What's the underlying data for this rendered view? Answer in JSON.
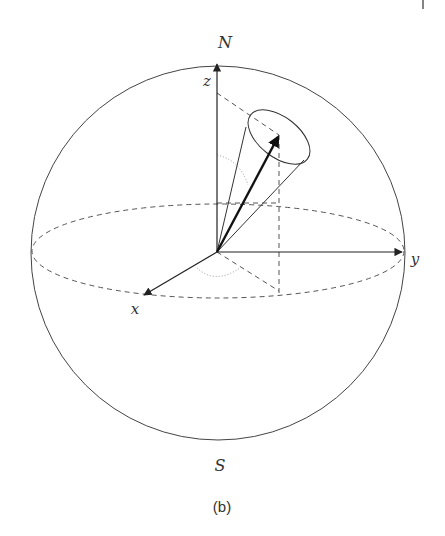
{
  "figure": {
    "caption": "(b)",
    "labels": {
      "north": "N",
      "south": "S",
      "x_axis": "x",
      "y_axis": "y",
      "z_axis": "z"
    },
    "colors": {
      "line": "#333333",
      "dashed": "#555555",
      "dotted": "#999999",
      "background": "#ffffff"
    }
  }
}
